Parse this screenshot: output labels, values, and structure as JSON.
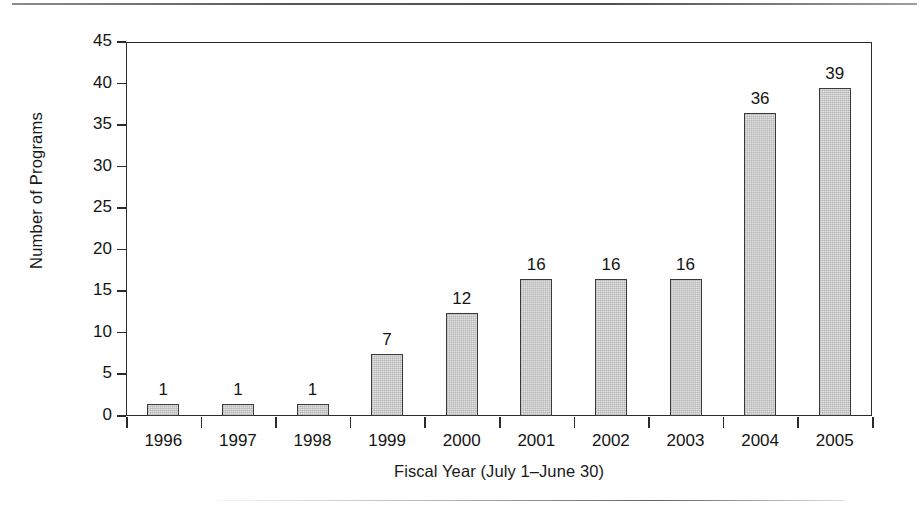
{
  "chart_data": {
    "type": "bar",
    "title": "",
    "subtitle": "",
    "xlabel": "Fiscal Year (July 1–June 30)",
    "ylabel": "Number of Programs",
    "categories": [
      "1996",
      "1997",
      "1998",
      "1999",
      "2000",
      "2001",
      "2002",
      "2003",
      "2004",
      "2005"
    ],
    "values": [
      1,
      1,
      1,
      7,
      12,
      16,
      16,
      16,
      36,
      39
    ],
    "data_labels": [
      "1",
      "1",
      "1",
      "7",
      "12",
      "16",
      "16",
      "16",
      "36",
      "39"
    ],
    "ylim": [
      0,
      45
    ],
    "y_ticks": [
      0,
      5,
      10,
      15,
      20,
      25,
      30,
      35,
      40,
      45
    ],
    "y_tick_labels": [
      "0",
      "5",
      "10",
      "15",
      "20",
      "25",
      "30",
      "35",
      "40",
      "45"
    ],
    "grid": false,
    "legend": null,
    "legend_position": "none",
    "bar_fill_color": "#e2e2e2",
    "bar_border_color": "#3a3a3a",
    "axis_color": "#2b2b2b",
    "text_color": "#141414"
  },
  "figure": {
    "page_rule_top": "",
    "page_rule_bottom": ""
  }
}
